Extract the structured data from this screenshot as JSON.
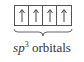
{
  "diagram": {
    "orbitals": [
      {
        "electron": "up"
      },
      {
        "electron": "up"
      },
      {
        "electron": "up"
      },
      {
        "electron": "up"
      }
    ],
    "label": {
      "prefix": "sp",
      "superscript": "3",
      "suffix": " orbitals"
    },
    "colors": {
      "stroke": "#555555",
      "text": "#333333"
    }
  }
}
